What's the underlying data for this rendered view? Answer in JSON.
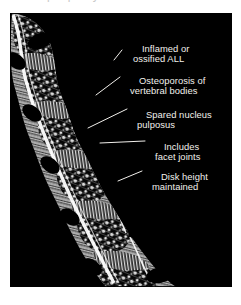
{
  "figure": {
    "kind": "medical-illustration",
    "background_color": "#000000",
    "ink_color": "#ffffff",
    "label_color": "#f2f0ec",
    "cropped_caption_fragment": "periphery"
  },
  "annotations": [
    {
      "id": "all",
      "line1": "Inflamed or",
      "line2": "ossified ALL",
      "x": 126,
      "y": 33
    },
    {
      "id": "osteoporosis",
      "line1": "Osteoporosis of",
      "line2": "vertebral bodies",
      "x": 123,
      "y": 65
    },
    {
      "id": "nucleus",
      "line1": "Spared nucleus",
      "line2": "pulposus",
      "x": 130,
      "y": 99
    },
    {
      "id": "facet",
      "line1": "Includes",
      "line2": "facet joints",
      "x": 148,
      "y": 131
    },
    {
      "id": "disk-height",
      "line1": "Disk height",
      "line2": "maintained",
      "x": 145,
      "y": 161
    }
  ],
  "leader_lines": [
    {
      "id": "leader-all",
      "points": "114,57 122,46"
    },
    {
      "id": "leader-osteoporosis",
      "points": "96,92 120,74"
    },
    {
      "id": "leader-nucleus",
      "points": "88,125 127,106"
    },
    {
      "id": "leader-facet",
      "points": "100,140 145,138"
    },
    {
      "id": "leader-disk-height",
      "points": "118,178 142,168"
    }
  ]
}
